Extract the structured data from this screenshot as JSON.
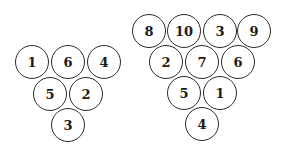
{
  "diagram": {
    "title": "",
    "style": {
      "stroke": "#2a2a2a",
      "text": "#1a1a1a",
      "background": "#ffffff"
    },
    "triangles": [
      {
        "name": "left-triangle",
        "rows": [
          [
            {
              "label": "1",
              "x": 32,
              "y": 62
            },
            {
              "label": "6",
              "x": 68,
              "y": 62
            },
            {
              "label": "4",
              "x": 104,
              "y": 62
            }
          ],
          [
            {
              "label": "5",
              "x": 50,
              "y": 94
            },
            {
              "label": "2",
              "x": 86,
              "y": 94
            }
          ],
          [
            {
              "label": "3",
              "x": 68,
              "y": 125
            }
          ]
        ]
      },
      {
        "name": "right-triangle",
        "rows": [
          [
            {
              "label": "8",
              "x": 149,
              "y": 31
            },
            {
              "label": "10",
              "x": 184,
              "y": 31
            },
            {
              "label": "3",
              "x": 220,
              "y": 31
            },
            {
              "label": "9",
              "x": 254,
              "y": 31
            }
          ],
          [
            {
              "label": "2",
              "x": 166,
              "y": 62
            },
            {
              "label": "7",
              "x": 202,
              "y": 62
            },
            {
              "label": "6",
              "x": 238,
              "y": 62
            }
          ],
          [
            {
              "label": "5",
              "x": 184,
              "y": 93
            },
            {
              "label": "1",
              "x": 220,
              "y": 93
            }
          ],
          [
            {
              "label": "4",
              "x": 202,
              "y": 124
            }
          ]
        ]
      }
    ]
  }
}
